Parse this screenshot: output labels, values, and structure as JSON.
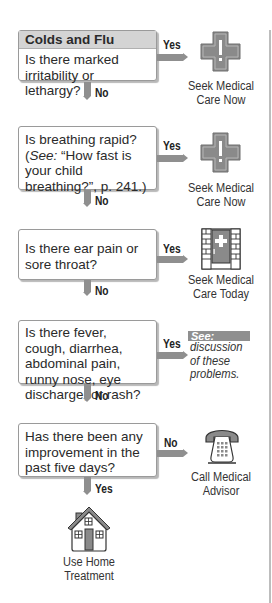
{
  "header": {
    "title": "Colds and Flu"
  },
  "steps": [
    {
      "question": "Is there marked irritability or lethargy?",
      "yes_label": "Yes",
      "no_label": "No",
      "outcome": {
        "icon": "medical-cross-icon",
        "line1": "Seek Medical",
        "line2": "Care Now"
      }
    },
    {
      "question_parts": {
        "pre": "Is breathing rapid? (",
        "see": "See:",
        "post": " “How fast is your child breathing?”, p. 241.)"
      },
      "yes_label": "Yes",
      "no_label": "No",
      "outcome": {
        "icon": "medical-cross-icon",
        "line1": "Seek Medical",
        "line2": "Care Now"
      }
    },
    {
      "question": "Is there ear pain or sore throat?",
      "yes_label": "Yes",
      "no_label": "No",
      "outcome": {
        "icon": "clinic-door-icon",
        "line1": "Seek Medical",
        "line2": "Care Today"
      }
    },
    {
      "question": "Is there fever, cough, diarrhea, abdominal pain, runny nose, eye discharge, or rash?",
      "yes_label": "Yes",
      "no_label": "No",
      "outcome": {
        "see_label": "See:",
        "line1": "discussion",
        "line2": "of these",
        "line3": "problems."
      }
    },
    {
      "question": "Has there been any improvement in the past five days?",
      "no_label": "No",
      "yes_label": "Yes",
      "outcome": {
        "icon": "telephone-icon",
        "line1": "Call Medical",
        "line2": "Advisor"
      }
    }
  ],
  "final": {
    "icon": "house-icon",
    "line1": "Use Home",
    "line2": "Treatment"
  },
  "colors": {
    "header_bg": "#d4d4d4",
    "arrow": "#8f8f8f",
    "icon_fill": "#8a8a8a",
    "box_border": "#9a9a9a"
  }
}
